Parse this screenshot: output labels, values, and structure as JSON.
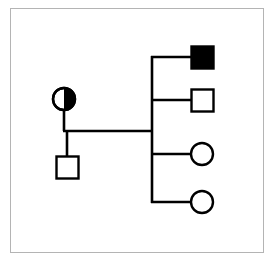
{
  "figure": {
    "title": "Pedigree chart",
    "description": "Two-generation pedigree: a carrier female mated to an unaffected male, with four offspring.",
    "canvas": {
      "width": 270,
      "height": 265
    },
    "colors": {
      "background": "#ffffff",
      "stroke": "#000000",
      "fill_affected": "#000000",
      "fill_unaffected": "#ffffff",
      "frame": "#b4b4b4"
    },
    "frame": {
      "x": 10,
      "y": 8,
      "width": 253,
      "height": 244,
      "stroke_width": 1
    }
  },
  "legend_semantics": {
    "square": "male",
    "circle": "female",
    "filled": "affected",
    "unfilled": "unaffected",
    "half-filled": "carrier"
  },
  "pedigree": {
    "line_width": 2.6,
    "symbol_size": 22,
    "generations": [
      {
        "id": "generation-1",
        "label": "I",
        "members": [
          {
            "id": "mother",
            "label": "I-1",
            "shape": "circle",
            "sex": "female",
            "status": "carrier",
            "fill": "half-right",
            "cx": 64,
            "cy": 99,
            "r": 11
          },
          {
            "id": "father",
            "label": "I-2",
            "shape": "square",
            "sex": "male",
            "status": "unaffected",
            "fill": "none",
            "x": 56,
            "y": 156,
            "size": 22
          }
        ]
      },
      {
        "id": "generation-2",
        "label": "II",
        "members": [
          {
            "id": "child-1",
            "label": "II-1",
            "shape": "square",
            "sex": "male",
            "status": "affected",
            "fill": "solid",
            "x": 191,
            "y": 46,
            "size": 22,
            "connector_y": 57
          },
          {
            "id": "child-2",
            "label": "II-2",
            "shape": "square",
            "sex": "male",
            "status": "unaffected",
            "fill": "none",
            "x": 191,
            "y": 89,
            "size": 22,
            "connector_y": 100
          },
          {
            "id": "child-3",
            "label": "II-3",
            "shape": "circle",
            "sex": "female",
            "status": "unaffected",
            "fill": "none",
            "cx": 202,
            "cy": 154,
            "r": 11,
            "connector_y": 154
          },
          {
            "id": "child-4",
            "label": "II-4",
            "shape": "circle",
            "sex": "female",
            "status": "unaffected",
            "fill": "none",
            "cx": 202,
            "cy": 202,
            "r": 11,
            "connector_y": 202
          }
        ]
      }
    ],
    "connectors": {
      "mother_drop": {
        "x": 64,
        "y1": 110,
        "y2": 131
      },
      "father_drop": {
        "x": 67,
        "y1": 131,
        "y2": 156
      },
      "mating_line": {
        "x1": 64,
        "x2": 152,
        "y": 131
      },
      "sibship_spine": {
        "x": 152,
        "y1": 57,
        "y2": 202
      }
    }
  }
}
